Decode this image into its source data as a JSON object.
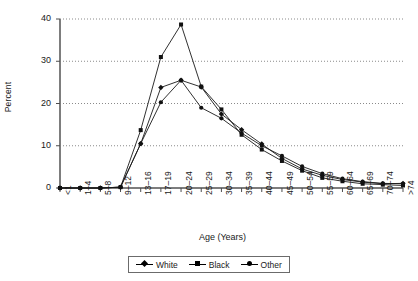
{
  "chart_data": {
    "type": "line",
    "title": "",
    "xlabel": "Age (Years)",
    "ylabel": "Percent",
    "ylim": [
      0,
      40
    ],
    "yticks": [
      0,
      10,
      20,
      30,
      40
    ],
    "grid": "horizontal-dotted",
    "legend_position": "bottom-center",
    "categories": [
      "<1",
      "1–4",
      "5–8",
      "9–12",
      "13–16",
      "17–19",
      "20–24",
      "25–29",
      "30–34",
      "35–39",
      "40–44",
      "45–49",
      "50–54",
      "55–59",
      "60–64",
      "65–69",
      "70–74",
      ">74"
    ],
    "series": [
      {
        "name": "White",
        "marker": "diamond",
        "values": [
          0,
          0,
          0,
          0.2,
          10.5,
          23.8,
          25.5,
          23.9,
          17.5,
          13.8,
          10.4,
          7.0,
          4.5,
          3.0,
          2.0,
          1.4,
          1.0,
          1.1
        ]
      },
      {
        "name": "Black",
        "marker": "square",
        "values": [
          0,
          0,
          0,
          0.2,
          13.7,
          31.0,
          38.7,
          24.0,
          18.6,
          12.6,
          9.1,
          6.4,
          4.1,
          2.4,
          1.6,
          1.0,
          0.8,
          0.6
        ]
      },
      {
        "name": "Other",
        "marker": "circle",
        "values": [
          0,
          0,
          0,
          0.2,
          10.5,
          20.3,
          25.5,
          19.0,
          16.5,
          13.0,
          10.0,
          7.6,
          5.1,
          3.4,
          2.2,
          1.5,
          1.1,
          1.0
        ]
      }
    ]
  },
  "axes": {
    "ytick_labels": [
      "40",
      "30",
      "20",
      "10",
      "0"
    ],
    "xtick_labels": [
      "<1",
      "1–4",
      "5–8",
      "9–12",
      "13–16",
      "17–19",
      "20–24",
      "25–29",
      "30–34",
      "35–39",
      "40–44",
      "45–49",
      "50–54",
      "55–59",
      "60–64",
      "65–69",
      "70–74",
      ">74"
    ]
  },
  "legend": {
    "items": [
      {
        "label": "White"
      },
      {
        "label": "Black"
      },
      {
        "label": "Other"
      }
    ]
  }
}
